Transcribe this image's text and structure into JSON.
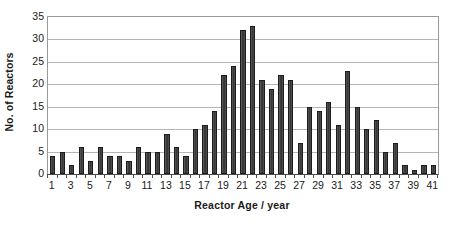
{
  "chart_data": {
    "type": "bar",
    "title": "",
    "xlabel": "Reactor Age / year",
    "ylabel": "No. of Reactors",
    "ylim": [
      0,
      35
    ],
    "ytick_step": 5,
    "yticks": [
      0,
      5,
      10,
      15,
      20,
      25,
      30,
      35
    ],
    "ytick_labels": [
      "0",
      "5",
      "10",
      "15",
      "20",
      "25",
      "30",
      "35"
    ],
    "grid": true,
    "grid_axis": "y",
    "legend": false,
    "legend_position": "none",
    "xlim": [
      0.5,
      41.5
    ],
    "xticks": [
      1,
      3,
      5,
      7,
      9,
      11,
      13,
      15,
      17,
      19,
      21,
      23,
      25,
      27,
      29,
      31,
      33,
      35,
      37,
      39,
      41
    ],
    "xtick_labels": [
      "1",
      "3",
      "5",
      "7",
      "9",
      "11",
      "13",
      "15",
      "17",
      "19",
      "21",
      "23",
      "25",
      "27",
      "29",
      "31",
      "33",
      "35",
      "37",
      "39",
      "41"
    ],
    "categories": [
      1,
      2,
      3,
      4,
      5,
      6,
      7,
      8,
      9,
      10,
      11,
      12,
      13,
      14,
      15,
      16,
      17,
      18,
      19,
      20,
      21,
      22,
      23,
      24,
      25,
      26,
      27,
      28,
      29,
      30,
      31,
      32,
      33,
      34,
      35,
      36,
      37,
      38,
      39,
      40,
      41
    ],
    "values": [
      4,
      5,
      2,
      6,
      3,
      6,
      4,
      4,
      3,
      6,
      5,
      5,
      9,
      6,
      4,
      10,
      11,
      14,
      22,
      24,
      32,
      33,
      21,
      19,
      22,
      21,
      7,
      15,
      14,
      16,
      11,
      23,
      15,
      10,
      12,
      5,
      7,
      2,
      1,
      2,
      2
    ],
    "bar_color": "#3d3d3d",
    "bar_edge_color": "#1c1c1c",
    "frame_color": "#9a9a9a",
    "grid_color": "#b5b5b5",
    "background_color": "#ffffff",
    "text_color": "#1a1a1a"
  }
}
